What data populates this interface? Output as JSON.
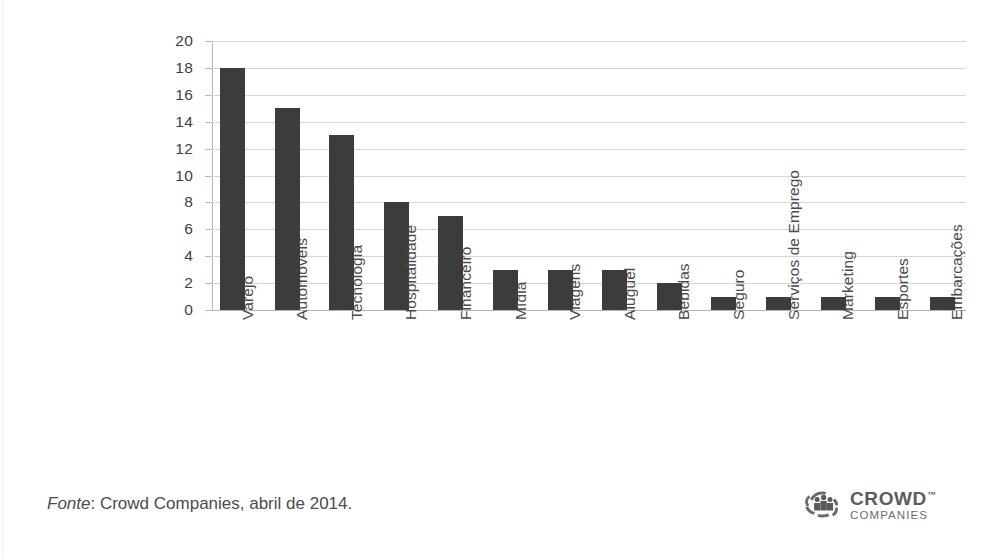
{
  "chart_data": {
    "type": "bar",
    "title": "",
    "subtitle": "",
    "xlabel": "",
    "ylabel": "",
    "ylim": [
      0,
      20
    ],
    "yticks": [
      0,
      2,
      4,
      6,
      8,
      10,
      12,
      14,
      16,
      18,
      20
    ],
    "grid": true,
    "legend": null,
    "orientation": "vertical",
    "bar_color": "#3c3c3c",
    "gridline_color": "#d7d7d7",
    "categories": [
      "Varejo",
      "Automóveis",
      "Tecnologia",
      "Hospitalidade",
      "Financeiro",
      "Mídia",
      "Viagens",
      "Aluguel",
      "Bebidas",
      "Seguro",
      "Serviços de Emprego",
      "Marketing",
      "Esportes",
      "Embarcações"
    ],
    "values": [
      18,
      15,
      13,
      8,
      7,
      3,
      3,
      3,
      2,
      1,
      1,
      1,
      1,
      1
    ]
  },
  "footer": {
    "source_label": "Fonte",
    "source_text": ": Crowd Companies, abril de 2014."
  },
  "brand": {
    "name": "CROWD",
    "trademark": "™",
    "subtitle": "COMPANIES",
    "mark_icon": "crowd-swirl-icon"
  }
}
